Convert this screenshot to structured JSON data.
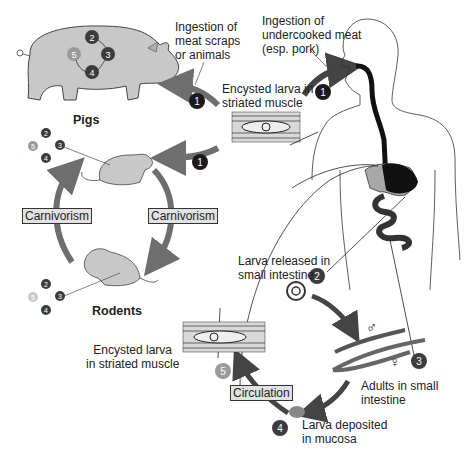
{
  "hosts": {
    "pigs": "Pigs",
    "rodents": "Rodents"
  },
  "labels": {
    "ingestion_scraps_1": "Ingestion of",
    "ingestion_scraps_2": "meat scraps",
    "ingestion_scraps_3": "or animals",
    "ingestion_meat_1": "Ingestion of",
    "ingestion_meat_2": "undercooked meat",
    "ingestion_meat_3": "(esp. pork)",
    "encysted_top_1": "Encysted larva in",
    "encysted_top_2": "striated muscle",
    "larva_released_1": "Larva released in",
    "larva_released_2": "small intestine",
    "adults_1": "Adults in small",
    "adults_2": "intestine",
    "deposited_1": "Larva deposited",
    "deposited_2": "in mucosa",
    "encysted_bottom_1": "Encysted larva",
    "encysted_bottom_2": "in striated muscle",
    "male_symbol": "♂",
    "female_symbol": "♀"
  },
  "boxes": {
    "carnivorism_left": "Carnivorism",
    "carnivorism_right": "Carnivorism",
    "circulation": "Circulation"
  },
  "steps": [
    "1",
    "2",
    "3",
    "4",
    "5"
  ],
  "colors": {
    "arrow": "#6e6e6e",
    "animal_fill": "#c8c8c8",
    "step_dark": "#1a1a1a",
    "step_mid": "#3c3c3c",
    "step_light": "#9a9a9a",
    "gut": "#111111",
    "liver": "#a8a8a8",
    "box_fill": "#e2e2e2"
  }
}
